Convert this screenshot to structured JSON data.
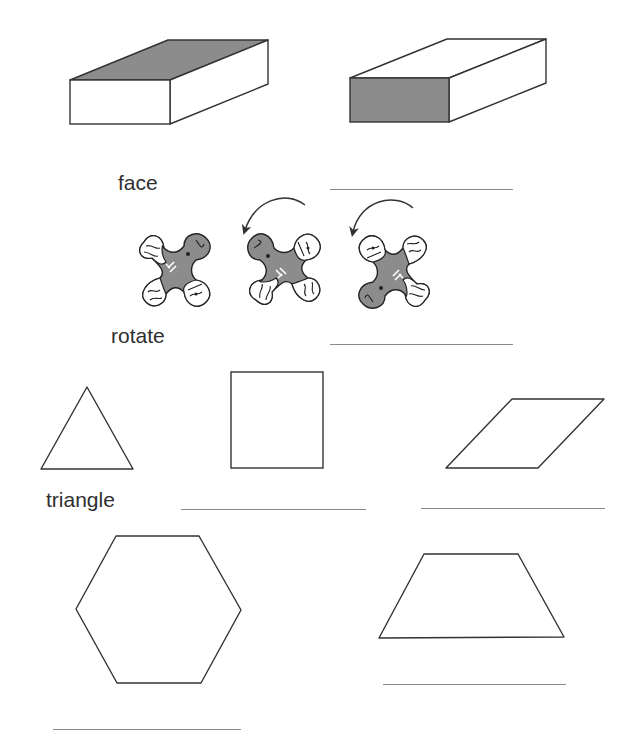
{
  "worksheet": {
    "colors": {
      "stroke": "#333333",
      "shade": "#8c8c8c",
      "line": "#8a8a8a",
      "text": "#2f2f2f"
    },
    "rows": [
      {
        "id": "prism-row",
        "figures": [
          {
            "type": "rectangular-prism",
            "shaded_face": "top"
          },
          {
            "type": "rectangular-prism",
            "shaded_face": "front"
          }
        ],
        "label": "face",
        "answer_blank": ""
      },
      {
        "id": "rotate-row",
        "figures": [
          {
            "type": "pinwheel-piece",
            "orientation": 0
          },
          {
            "type": "rotation-arrow",
            "direction": "counterclockwise"
          },
          {
            "type": "pinwheel-piece",
            "orientation": 90
          },
          {
            "type": "rotation-arrow",
            "direction": "counterclockwise"
          },
          {
            "type": "pinwheel-piece",
            "orientation": 180
          }
        ],
        "label": "rotate",
        "answer_blank": ""
      },
      {
        "id": "shapes-row-1",
        "figures": [
          {
            "type": "triangle",
            "label": "triangle"
          },
          {
            "type": "square",
            "answer_blank": ""
          },
          {
            "type": "parallelogram",
            "answer_blank": ""
          }
        ]
      },
      {
        "id": "shapes-row-2",
        "figures": [
          {
            "type": "hexagon",
            "answer_blank": ""
          },
          {
            "type": "trapezoid",
            "answer_blank": ""
          }
        ]
      }
    ],
    "labels": {
      "face": "face",
      "rotate": "rotate",
      "triangle": "triangle"
    }
  }
}
